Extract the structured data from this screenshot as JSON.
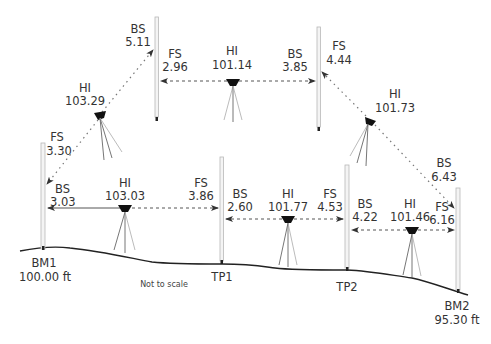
{
  "note": "Not to scale",
  "colors": {
    "ground": "#222222",
    "sight": "#555555",
    "rod": "#b8b8b8",
    "text": "#333333"
  },
  "stations": [
    {
      "id": "BM1",
      "label": "BM1",
      "elevation": "100.00 ft"
    },
    {
      "id": "TP1",
      "label": "TP1"
    },
    {
      "id": "TP2",
      "label": "TP2"
    },
    {
      "id": "BM2",
      "label": "BM2",
      "elevation": "95.30 ft"
    }
  ],
  "setups": [
    {
      "name": "setup-1",
      "bs": "3.03",
      "hi": "103.03",
      "fs": "3.86"
    },
    {
      "name": "setup-2",
      "bs": "2.60",
      "hi": "101.77",
      "fs": "4.53"
    },
    {
      "name": "setup-3",
      "bs": "4.22",
      "hi": "101.46",
      "fs": "6.16"
    },
    {
      "name": "setup-4-upper-left",
      "bs": "5.11",
      "hi": "103.29",
      "fs": "3.30"
    },
    {
      "name": "setup-5-upper",
      "bs": "3.85",
      "hi": "101.14",
      "fs": "2.96"
    },
    {
      "name": "setup-6-upper-right",
      "bs": "6.43",
      "hi": "101.73",
      "fs": "4.44"
    }
  ],
  "labels": {
    "bs": "BS",
    "fs": "FS",
    "hi": "HI"
  }
}
